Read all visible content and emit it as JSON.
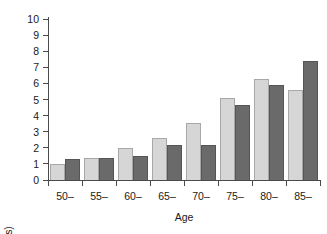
{
  "chart_data": {
    "type": "bar",
    "title": "",
    "xlabel": "Age",
    "ylabel": "Incidence (/1000 years)",
    "categories": [
      "50–",
      "55–",
      "60–",
      "65–",
      "70–",
      "75–",
      "80–",
      "85–"
    ],
    "series": [
      {
        "name": "light",
        "color": "#d6d6d6",
        "values": [
          1.0,
          1.35,
          2.0,
          2.6,
          3.55,
          5.1,
          6.3,
          5.6
        ]
      },
      {
        "name": "dark",
        "color": "#6a6a6a",
        "values": [
          1.3,
          1.35,
          1.5,
          2.2,
          2.2,
          4.65,
          5.9,
          7.4
        ]
      }
    ],
    "ylim": [
      0,
      10
    ],
    "ytick_labels": [
      "0",
      "1",
      "2",
      "3",
      "4",
      "5",
      "6",
      "7",
      "8",
      "9",
      "10"
    ],
    "ytick_values": [
      0,
      1,
      2,
      3,
      4,
      5,
      6,
      7,
      8,
      9,
      10
    ],
    "grid": false,
    "legend": "none"
  }
}
